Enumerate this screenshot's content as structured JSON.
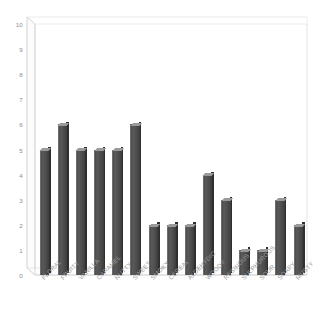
{
  "chart_data": {
    "type": "bar",
    "title": "",
    "subtitle": "",
    "xlabel": "",
    "ylabel": "",
    "ylim": [
      0,
      10
    ],
    "ytick_labels": [
      "0",
      "1",
      "2",
      "3",
      "4",
      "5",
      "6",
      "7",
      "8",
      "9",
      "10"
    ],
    "grid": false,
    "legend": null,
    "style": "3d-column",
    "categories": [
      "FLORAL",
      "FRUITY",
      "VANILLA",
      "CARAMEL",
      "NUTTY",
      "SWEET",
      "SMOKY",
      "CEREAL",
      "ALDEHYDIC",
      "WOODY",
      "RESINOUS",
      "SULPHUROUS",
      "SOUR",
      "SOAPY",
      "MUSTY"
    ],
    "values": [
      5,
      6,
      5,
      5,
      5,
      6,
      2,
      2,
      2,
      4,
      3,
      1,
      1,
      3,
      2
    ],
    "colors": {
      "bar_front": "#4f4f4f",
      "bar_side": "#2f2f2f",
      "bar_top": "#9a9a9a",
      "axis_line": "#cfcfcf",
      "tick_text": "#8d8d8d",
      "category_text": "#9b9b9b",
      "background": "#ffffff"
    }
  }
}
